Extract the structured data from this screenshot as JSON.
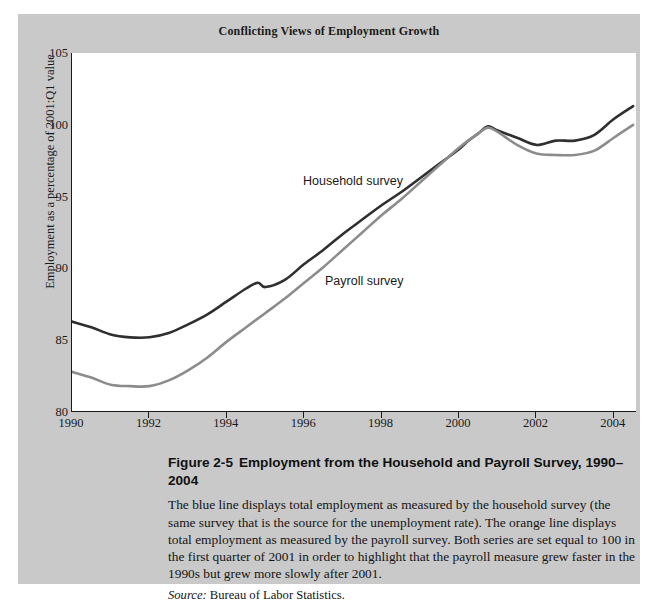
{
  "figure": {
    "chart_title": "Conflicting Views of Employment Growth",
    "caption_figure_number": "Figure 2-5",
    "caption_title": "Employment from the Household and Payroll Survey, 1990–2004",
    "caption_body": "The blue line displays total employment as measured by the household survey (the same survey that is the source for the unemployment rate). The orange line displays total employment as measured by the payroll survey. Both series are set equal to 100 in the first quarter of 2001 in order to highlight that the payroll measure grew faster in the 1990s but grew more slowly after 2001.",
    "source_label": "Source:",
    "source_text": "Bureau of Labor Statistics.",
    "panel_background": "#c9c9c9",
    "plot_background": "#ffffff"
  },
  "chart_data": {
    "type": "line",
    "title": "Conflicting Views of Employment Growth",
    "xlabel": "",
    "ylabel": "Employment as a percentage of 2001:Q1 value",
    "xlim": [
      1990,
      2004.6
    ],
    "ylim": [
      80,
      105
    ],
    "xticks": [
      1990,
      1992,
      1994,
      1996,
      1998,
      2000,
      2002,
      2004
    ],
    "yticks": [
      80,
      85,
      90,
      95,
      100,
      105
    ],
    "grid": false,
    "legend": "inline-annotations",
    "series": [
      {
        "name": "Household survey",
        "color": "#2f2f2f",
        "annotation": "Household survey",
        "x": [
          1990.0,
          1990.5,
          1991.0,
          1991.5,
          1992.0,
          1992.5,
          1993.0,
          1993.5,
          1994.0,
          1994.5,
          1994.8,
          1995.0,
          1995.5,
          1996.0,
          1996.5,
          1997.0,
          1997.5,
          1998.0,
          1998.5,
          1999.0,
          1999.5,
          2000.0,
          2000.25,
          2000.5,
          2000.75,
          2001.0,
          2001.5,
          2002.0,
          2002.5,
          2003.0,
          2003.5,
          2004.0,
          2004.5
        ],
        "y": [
          86.3,
          85.9,
          85.4,
          85.2,
          85.2,
          85.5,
          86.1,
          86.8,
          87.7,
          88.6,
          89.0,
          88.7,
          89.2,
          90.3,
          91.3,
          92.4,
          93.4,
          94.4,
          95.3,
          96.3,
          97.3,
          98.3,
          98.9,
          99.4,
          99.9,
          99.6,
          99.1,
          98.6,
          98.9,
          98.9,
          99.3,
          100.4,
          101.3
        ]
      },
      {
        "name": "Payroll survey",
        "color": "#8c8c8c",
        "annotation": "Payroll survey",
        "x": [
          1990.0,
          1990.5,
          1991.0,
          1991.5,
          1992.0,
          1992.5,
          1993.0,
          1993.5,
          1994.0,
          1994.5,
          1995.0,
          1995.5,
          1996.0,
          1996.5,
          1997.0,
          1997.5,
          1998.0,
          1998.5,
          1999.0,
          1999.5,
          2000.0,
          2000.5,
          2000.75,
          2001.0,
          2001.5,
          2002.0,
          2002.5,
          2003.0,
          2003.5,
          2004.0,
          2004.5
        ],
        "y": [
          82.8,
          82.4,
          81.9,
          81.8,
          81.8,
          82.2,
          82.9,
          83.8,
          84.9,
          85.9,
          86.9,
          87.9,
          89.0,
          90.1,
          91.3,
          92.5,
          93.7,
          94.8,
          96.0,
          97.2,
          98.4,
          99.4,
          99.8,
          99.5,
          98.6,
          98.0,
          97.9,
          97.9,
          98.2,
          99.1,
          100.0
        ]
      }
    ]
  }
}
